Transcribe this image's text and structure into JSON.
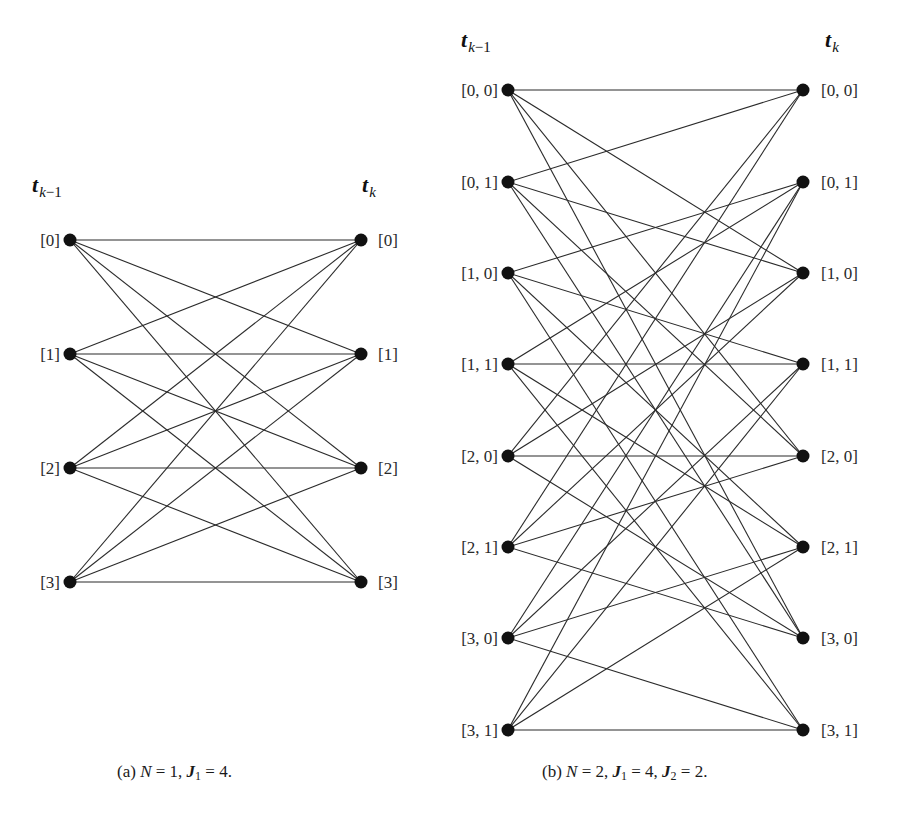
{
  "style": {
    "edge_color": "#2b2b2b",
    "node_color": "#111111",
    "background": "#ffffff"
  },
  "panels": [
    {
      "id": "a",
      "header_left": {
        "main": "t",
        "sub": "k−1",
        "x": 32,
        "y": 192
      },
      "header_right": {
        "main": "t",
        "sub": "k",
        "x": 362,
        "y": 192
      },
      "left_x": 70,
      "right_x": 361,
      "left_label_x": 60,
      "right_label_x": 378,
      "left_nodes": [
        {
          "label": "[0]",
          "y": 240
        },
        {
          "label": "[1]",
          "y": 354
        },
        {
          "label": "[2]",
          "y": 468
        },
        {
          "label": "[3]",
          "y": 582
        }
      ],
      "right_nodes": [
        {
          "label": "[0]",
          "y": 240
        },
        {
          "label": "[1]",
          "y": 354
        },
        {
          "label": "[2]",
          "y": 468
        },
        {
          "label": "[3]",
          "y": 582
        }
      ],
      "edges": [
        [
          0,
          0
        ],
        [
          0,
          1
        ],
        [
          0,
          2
        ],
        [
          0,
          3
        ],
        [
          1,
          0
        ],
        [
          1,
          1
        ],
        [
          1,
          2
        ],
        [
          1,
          3
        ],
        [
          2,
          0
        ],
        [
          2,
          1
        ],
        [
          2,
          2
        ],
        [
          2,
          3
        ],
        [
          3,
          0
        ],
        [
          3,
          1
        ],
        [
          3,
          2
        ],
        [
          3,
          3
        ]
      ],
      "caption": {
        "prefix": "(a) ",
        "N_sym": "N",
        "N_val": " = 1, ",
        "J1_sym": "J",
        "J1_sub": "1",
        "J1_val": " = 4.",
        "x": 117,
        "y": 762
      }
    },
    {
      "id": "b",
      "header_left": {
        "main": "t",
        "sub": "k−1",
        "x": 461,
        "y": 47
      },
      "header_right": {
        "main": "t",
        "sub": "k",
        "x": 825,
        "y": 47
      },
      "left_x": 508,
      "right_x": 803,
      "left_label_x": 498,
      "right_label_x": 821,
      "left_nodes": [
        {
          "label": "[0, 0]",
          "y": 90
        },
        {
          "label": "[0, 1]",
          "y": 182
        },
        {
          "label": "[1, 0]",
          "y": 273
        },
        {
          "label": "[1, 1]",
          "y": 364
        },
        {
          "label": "[2, 0]",
          "y": 456
        },
        {
          "label": "[2, 1]",
          "y": 547
        },
        {
          "label": "[3, 0]",
          "y": 638
        },
        {
          "label": "[3, 1]",
          "y": 730
        }
      ],
      "right_nodes": [
        {
          "label": "[0, 0]",
          "y": 90
        },
        {
          "label": "[0, 1]",
          "y": 182
        },
        {
          "label": "[1, 0]",
          "y": 273
        },
        {
          "label": "[1, 1]",
          "y": 364
        },
        {
          "label": "[2, 0]",
          "y": 456
        },
        {
          "label": "[2, 1]",
          "y": 547
        },
        {
          "label": "[3, 0]",
          "y": 638
        },
        {
          "label": "[3, 1]",
          "y": 730
        }
      ],
      "edges": [
        [
          0,
          0
        ],
        [
          0,
          2
        ],
        [
          0,
          4
        ],
        [
          0,
          6
        ],
        [
          1,
          0
        ],
        [
          1,
          2
        ],
        [
          1,
          4
        ],
        [
          1,
          6
        ],
        [
          2,
          1
        ],
        [
          2,
          3
        ],
        [
          2,
          5
        ],
        [
          2,
          7
        ],
        [
          3,
          1
        ],
        [
          3,
          3
        ],
        [
          3,
          5
        ],
        [
          3,
          7
        ],
        [
          4,
          0
        ],
        [
          4,
          2
        ],
        [
          4,
          4
        ],
        [
          4,
          6
        ],
        [
          5,
          0
        ],
        [
          5,
          2
        ],
        [
          5,
          4
        ],
        [
          5,
          6
        ],
        [
          6,
          1
        ],
        [
          6,
          3
        ],
        [
          6,
          5
        ],
        [
          6,
          7
        ],
        [
          7,
          1
        ],
        [
          7,
          3
        ],
        [
          7,
          5
        ],
        [
          7,
          7
        ]
      ],
      "caption": {
        "prefix": "(b) ",
        "N_sym": "N",
        "N_val": " = 2, ",
        "J1_sym": "J",
        "J1_sub": "1",
        "J1_val": " = 4, ",
        "J2_sym": "J",
        "J2_sub": "2",
        "J2_val": " = 2.",
        "x": 542,
        "y": 762
      }
    }
  ]
}
